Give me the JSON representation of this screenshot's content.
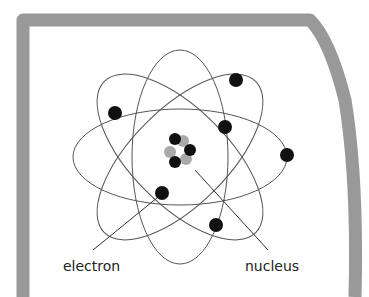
{
  "diagram": {
    "colors": {
      "frame": "#999999",
      "background": "#ffffff",
      "orbit": "#555555",
      "electron": "#111111",
      "proton": "#111111",
      "neutron": "#aaaaaa",
      "leader_line": "#333333"
    },
    "orbits": [
      {
        "cx": 180,
        "cy": 157,
        "rx": 107,
        "ry": 48,
        "rotate": 0
      },
      {
        "cx": 180,
        "cy": 157,
        "rx": 107,
        "ry": 48,
        "rotate": 45
      },
      {
        "cx": 180,
        "cy": 157,
        "rx": 107,
        "ry": 48,
        "rotate": 90
      },
      {
        "cx": 180,
        "cy": 157,
        "rx": 107,
        "ry": 48,
        "rotate": 135
      }
    ],
    "electrons": [
      {
        "cx": 115,
        "cy": 113
      },
      {
        "cx": 236,
        "cy": 80
      },
      {
        "cx": 225,
        "cy": 127
      },
      {
        "cx": 287,
        "cy": 155
      },
      {
        "cx": 162,
        "cy": 193
      },
      {
        "cx": 216,
        "cy": 225
      }
    ],
    "nucleus": {
      "neutrons": [
        {
          "cx": 183,
          "cy": 141
        },
        {
          "cx": 170,
          "cy": 152
        },
        {
          "cx": 186,
          "cy": 159
        }
      ],
      "protons": [
        {
          "cx": 175,
          "cy": 139
        },
        {
          "cx": 190,
          "cy": 150
        },
        {
          "cx": 175,
          "cy": 162
        }
      ]
    },
    "labels": {
      "electron": {
        "text": "electron",
        "x": 63,
        "y": 271
      },
      "nucleus": {
        "text": "nucleus",
        "x": 245,
        "y": 271
      }
    },
    "leaders": {
      "electron": {
        "x1": 163,
        "y1": 193,
        "x2": 93,
        "y2": 250
      },
      "nucleus": {
        "x1": 195,
        "y1": 170,
        "x2": 268,
        "y2": 250
      }
    }
  }
}
